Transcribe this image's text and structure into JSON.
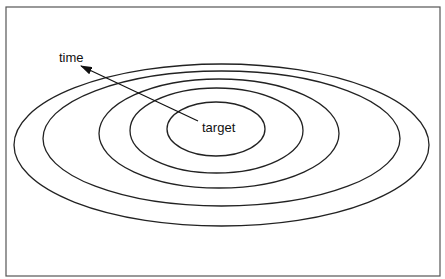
{
  "diagram": {
    "type": "concentric-ellipses",
    "labels": {
      "center": "target",
      "arrow": "time"
    },
    "frame": {
      "x": 6,
      "y": 7,
      "width": 434,
      "height": 269,
      "stroke": "#555555"
    },
    "stroke_color": "#222222",
    "ellipses": [
      {
        "cx": 221.5,
        "cy": 145,
        "rx": 207.5,
        "ry": 81
      },
      {
        "cx": 221.5,
        "cy": 138.5,
        "rx": 178.5,
        "ry": 67.5
      },
      {
        "cx": 219,
        "cy": 133.5,
        "rx": 120,
        "ry": 54.5
      },
      {
        "cx": 216.5,
        "cy": 130.5,
        "rx": 86.5,
        "ry": 42.5
      },
      {
        "cx": 216,
        "cy": 129,
        "rx": 49,
        "ry": 27
      }
    ],
    "arrow": {
      "from": [
        198,
        121
      ],
      "to": [
        81,
        66
      ]
    },
    "text_positions": {
      "center": {
        "x": 202,
        "y": 132
      },
      "arrow": {
        "x": 59,
        "y": 62
      }
    }
  }
}
